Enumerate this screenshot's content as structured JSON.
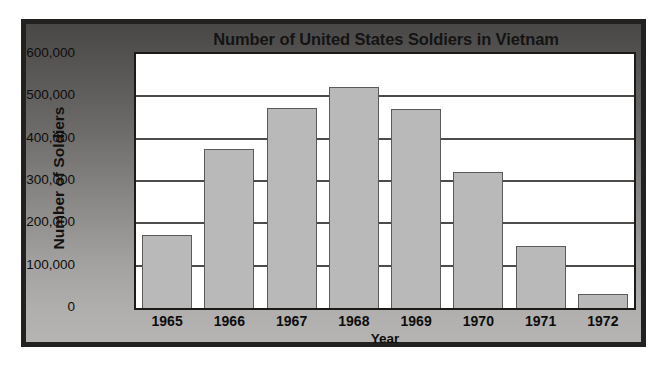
{
  "chart_data": {
    "type": "bar",
    "title": "Number of United States Soldiers in Vietnam",
    "xlabel": "Year",
    "ylabel": "Number of Soldiers",
    "categories": [
      "1965",
      "1966",
      "1967",
      "1968",
      "1969",
      "1970",
      "1971",
      "1972"
    ],
    "values": [
      173000,
      375000,
      473000,
      523000,
      470000,
      322000,
      147000,
      32000
    ],
    "ylim": [
      0,
      600000
    ],
    "ytick_labels": [
      "600,000",
      "500,000",
      "400,000",
      "300,000",
      "200,000",
      "100,000",
      "0"
    ],
    "ytick_values": [
      600000,
      500000,
      400000,
      300000,
      200000,
      100000,
      0
    ],
    "grid": true,
    "legend": false,
    "bar_color": "#b9b9b9",
    "bar_edge_color": "#5c5a58",
    "plot_background": "#ffffff",
    "panel_background": "#8b8987",
    "frame_color": "#23211f",
    "text_color": "#0d0d0d"
  }
}
